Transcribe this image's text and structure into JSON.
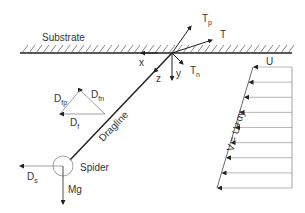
{
  "labels": {
    "substrate": "Substrate",
    "x_axis": "x",
    "y_axis": "y",
    "z_axis": "z",
    "tension": "T",
    "tension_p_main": "T",
    "tension_p_sub": "p",
    "tension_n_main": "T",
    "tension_n_sub": "n",
    "drag_fp_main": "D",
    "drag_fp_sub": "fp",
    "drag_fn_main": "D",
    "drag_fn_sub": "fn",
    "drag_f_main": "D",
    "drag_f_sub": "f",
    "drag_s_main": "D",
    "drag_s_sub": "s",
    "dragline": "Dragline",
    "spider": "Spider",
    "weight": "Mg",
    "flow_u": "U",
    "flow_equation": "V = U+αy"
  },
  "colors": {
    "line": "#222222",
    "thin_line": "#888888",
    "text": "#333333"
  }
}
